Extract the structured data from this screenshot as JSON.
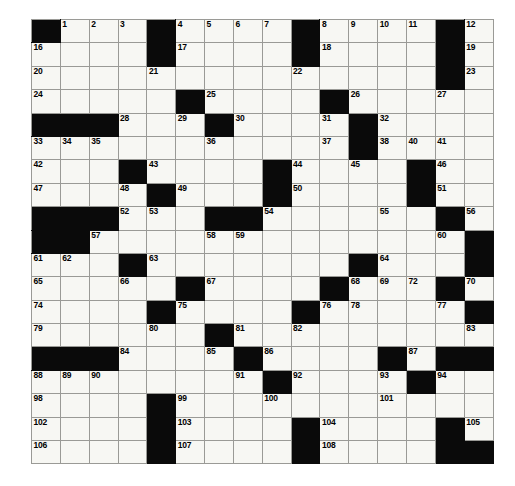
{
  "puzzle": {
    "title": "Crossword Grid",
    "rows": 19,
    "cols": 16,
    "colors": {
      "block": "#0a0a0a",
      "cell": "#f7f7f3",
      "grid_line": "#9a9a96",
      "number": "#000000",
      "background": "#ffffff"
    },
    "grid": [
      [
        {
          "b": true
        },
        {
          "n": "1"
        },
        {
          "n": "2"
        },
        {
          "n": "3"
        },
        {
          "b": true
        },
        {
          "n": "4"
        },
        {
          "n": "5"
        },
        {
          "n": "6"
        },
        {
          "n": "7"
        },
        {
          "b": true
        },
        {
          "n": "8"
        },
        {
          "n": "9"
        },
        {
          "n": "10"
        },
        {
          "n": "11"
        },
        {
          "b": true
        },
        {
          "n": "12"
        }
      ],
      [
        {
          "n": "16"
        },
        {},
        {},
        {},
        {
          "b": true
        },
        {
          "n": "17"
        },
        {},
        {},
        {},
        {
          "b": true
        },
        {
          "n": "18"
        },
        {},
        {},
        {},
        {
          "b": true
        },
        {
          "n": "19"
        }
      ],
      [
        {
          "n": "20"
        },
        {},
        {},
        {},
        {
          "n": "21"
        },
        {},
        {},
        {},
        {},
        {
          "n": "22"
        },
        {},
        {},
        {},
        {},
        {
          "b": true
        },
        {
          "n": "23"
        }
      ],
      [
        {
          "n": "24"
        },
        {},
        {},
        {},
        {},
        {
          "b": true
        },
        {
          "n": "25"
        },
        {},
        {},
        {},
        {
          "b": true
        },
        {
          "n": "26"
        },
        {},
        {},
        {
          "n": "27"
        },
        {}
      ],
      [
        {
          "b": true
        },
        {
          "b": true
        },
        {
          "b": true
        },
        {
          "n": "28"
        },
        {},
        {
          "n": "29"
        },
        {
          "b": true
        },
        {
          "n": "30"
        },
        {},
        {},
        {
          "n": "31"
        },
        {
          "b": true
        },
        {
          "n": "32"
        },
        {},
        {},
        {}
      ],
      [
        {
          "n": "33"
        },
        {
          "n": "34"
        },
        {
          "n": "35"
        },
        {},
        {},
        {},
        {
          "n": "36"
        },
        {},
        {},
        {},
        {
          "n": "37"
        },
        {
          "b": true
        },
        {
          "n": "38"
        },
        {},
        {},
        {}
      ],
      [
        {
          "n": "42"
        },
        {},
        {},
        {
          "b": true
        },
        {
          "n": "43"
        },
        {},
        {},
        {},
        {
          "b": true
        },
        {
          "n": "44"
        },
        {},
        {
          "n": "45"
        },
        {},
        {
          "b": true
        },
        {
          "n": "46"
        },
        {}
      ],
      [
        {
          "n": "47"
        },
        {},
        {},
        {
          "n": "48"
        },
        {
          "b": true
        },
        {
          "n": "49"
        },
        {},
        {},
        {
          "b": true
        },
        {
          "n": "50"
        },
        {},
        {},
        {},
        {
          "b": true
        },
        {
          "n": "51"
        },
        {}
      ],
      [
        {
          "b": true
        },
        {
          "b": true
        },
        {
          "b": true
        },
        {
          "n": "52"
        },
        {
          "n": "53"
        },
        {},
        {
          "b": true
        },
        {
          "b": true
        },
        {
          "n": "54"
        },
        {},
        {},
        {},
        {
          "n": "55"
        },
        {},
        {
          "b": true
        },
        {
          "n": "56"
        }
      ],
      [
        {
          "b": true
        },
        {
          "b": true
        },
        {
          "n": "57"
        },
        {},
        {},
        {},
        {
          "n": "58"
        },
        {
          "n": "59"
        },
        {},
        {},
        {},
        {},
        {},
        {},
        {
          "n": "60"
        },
        {}
      ],
      [
        {
          "n": "61"
        },
        {
          "n": "62"
        },
        {},
        {
          "b": true
        },
        {
          "n": "63"
        },
        {},
        {},
        {},
        {},
        {},
        {},
        {
          "b": true
        },
        {
          "n": "64"
        },
        {},
        {},
        {
          "b": true
        }
      ],
      [
        {
          "n": "65"
        },
        {},
        {},
        {
          "n": "66"
        },
        {},
        {
          "b": true
        },
        {
          "n": "67"
        },
        {},
        {},
        {},
        {
          "b": true
        },
        {
          "n": "68"
        },
        {
          "n": "69"
        },
        {},
        {
          "b": true
        },
        {
          "n": "70"
        }
      ],
      [
        {
          "n": "74"
        },
        {},
        {},
        {},
        {
          "b": true
        },
        {
          "n": "75"
        },
        {},
        {},
        {},
        {
          "b": true
        },
        {
          "n": "76"
        },
        {},
        {},
        {},
        {
          "n": "77"
        },
        {
          "b": true
        }
      ],
      [
        {
          "n": "79"
        },
        {},
        {},
        {},
        {
          "n": "80"
        },
        {},
        {
          "b": true
        },
        {
          "n": "81"
        },
        {},
        {
          "n": "82"
        },
        {},
        {},
        {},
        {},
        {},
        {
          "n": "83"
        }
      ],
      [
        {
          "b": true
        },
        {
          "b": true
        },
        {
          "b": true
        },
        {
          "n": "84"
        },
        {},
        {},
        {
          "n": "85"
        },
        {
          "b": true
        },
        {
          "n": "86"
        },
        {},
        {},
        {},
        {
          "b": true
        },
        {
          "n": "87"
        },
        {},
        {}
      ],
      [
        {
          "n": "88"
        },
        {
          "n": "89"
        },
        {
          "n": "90"
        },
        {},
        {},
        {},
        {},
        {
          "n": "91"
        },
        {
          "b": true
        },
        {
          "n": "92"
        },
        {},
        {},
        {
          "n": "93"
        },
        {
          "b": true
        },
        {
          "n": "94"
        },
        {}
      ],
      [
        {
          "n": "98"
        },
        {},
        {},
        {},
        {
          "b": true
        },
        {
          "n": "99"
        },
        {},
        {},
        {
          "n": "100"
        },
        {},
        {},
        {},
        {
          "n": "101"
        },
        {},
        {},
        {}
      ],
      [
        {
          "n": "102"
        },
        {},
        {},
        {},
        {
          "b": true
        },
        {
          "n": "103"
        },
        {},
        {},
        {},
        {
          "b": true
        },
        {
          "n": "104"
        },
        {},
        {},
        {},
        {
          "b": true
        },
        {
          "n": "105"
        }
      ],
      [
        {
          "n": "106"
        },
        {},
        {},
        {},
        {
          "b": true
        },
        {
          "n": "107"
        },
        {},
        {},
        {},
        {
          "b": true
        },
        {
          "n": "108"
        },
        {},
        {},
        {},
        {
          "b": true
        },
        {
          "n": "109"
        }
      ]
    ],
    "extra_numbers": {
      "row1_right": [
        "13",
        "14",
        "15"
      ],
      "row6_right": [
        "39",
        "40",
        "41"
      ],
      "row12_right": [
        "71",
        "72",
        "73"
      ],
      "row13_right": [
        "78"
      ],
      "row16_right": [
        "95",
        "96",
        "97"
      ]
    }
  }
}
